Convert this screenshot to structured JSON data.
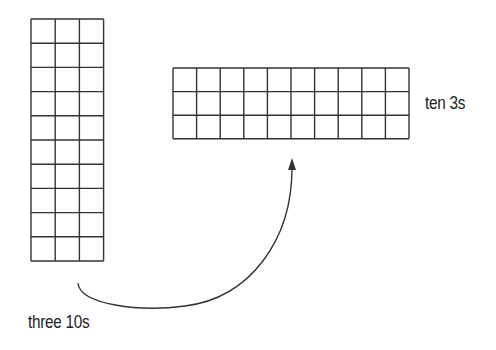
{
  "diagram": {
    "left_grid": {
      "name": "three 10s grid",
      "rows": 10,
      "cols": 3,
      "x": 31,
      "y": 19,
      "cell": 24.2
    },
    "right_grid": {
      "name": "ten 3s grid",
      "rows": 3,
      "cols": 10,
      "x": 173,
      "y": 68,
      "cell": 23.6
    },
    "labels": {
      "left": "three 10s",
      "right": "ten 3s"
    },
    "arrow": {
      "from": [
        78,
        283
      ],
      "to": [
        292,
        160
      ],
      "description": "curved arrow from left grid to right grid"
    },
    "line_color": "#333333"
  }
}
